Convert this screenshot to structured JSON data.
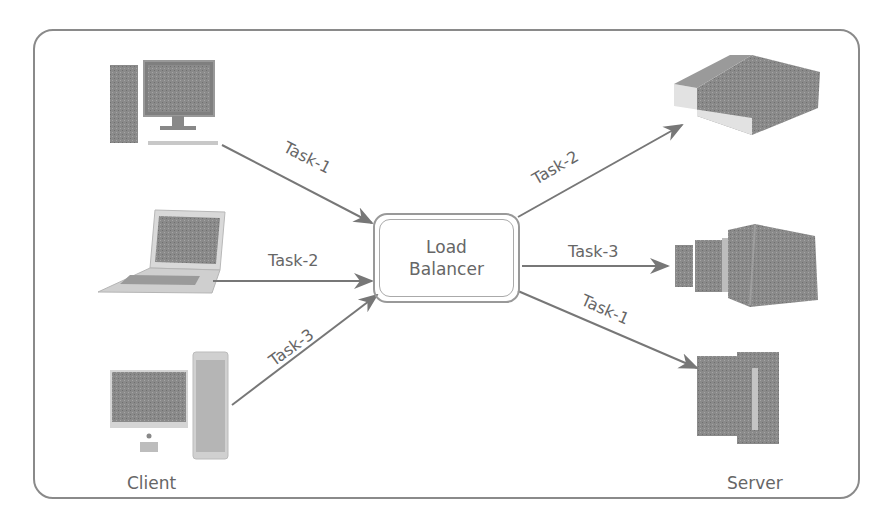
{
  "diagram": {
    "title": "",
    "load_balancer": {
      "line1": "Load",
      "line2": "Balancer"
    },
    "captions": {
      "client": "Client",
      "server": "Server"
    },
    "clients": [
      {
        "name": "desktop-pc",
        "icon": "desktop-computer-icon"
      },
      {
        "name": "laptop",
        "icon": "laptop-icon"
      },
      {
        "name": "imac-with-tower",
        "icon": "all-in-one-computer-icon"
      }
    ],
    "servers": [
      {
        "name": "rack-server",
        "icon": "rack-server-icon"
      },
      {
        "name": "server-cluster",
        "icon": "server-cluster-icon"
      },
      {
        "name": "mainframe",
        "icon": "mainframe-server-icon"
      }
    ],
    "edges": [
      {
        "from": "desktop-pc",
        "to": "load_balancer",
        "label": "Task-1"
      },
      {
        "from": "laptop",
        "to": "load_balancer",
        "label": "Task-2"
      },
      {
        "from": "imac-with-tower",
        "to": "load_balancer",
        "label": "Task-3"
      },
      {
        "from": "load_balancer",
        "to": "rack-server",
        "label": "Task-2"
      },
      {
        "from": "load_balancer",
        "to": "server-cluster",
        "label": "Task-3"
      },
      {
        "from": "load_balancer",
        "to": "mainframe",
        "label": "Task-1"
      }
    ],
    "colors": {
      "stroke": "#777777",
      "device": "#8c8c8c",
      "text": "#666666"
    }
  }
}
